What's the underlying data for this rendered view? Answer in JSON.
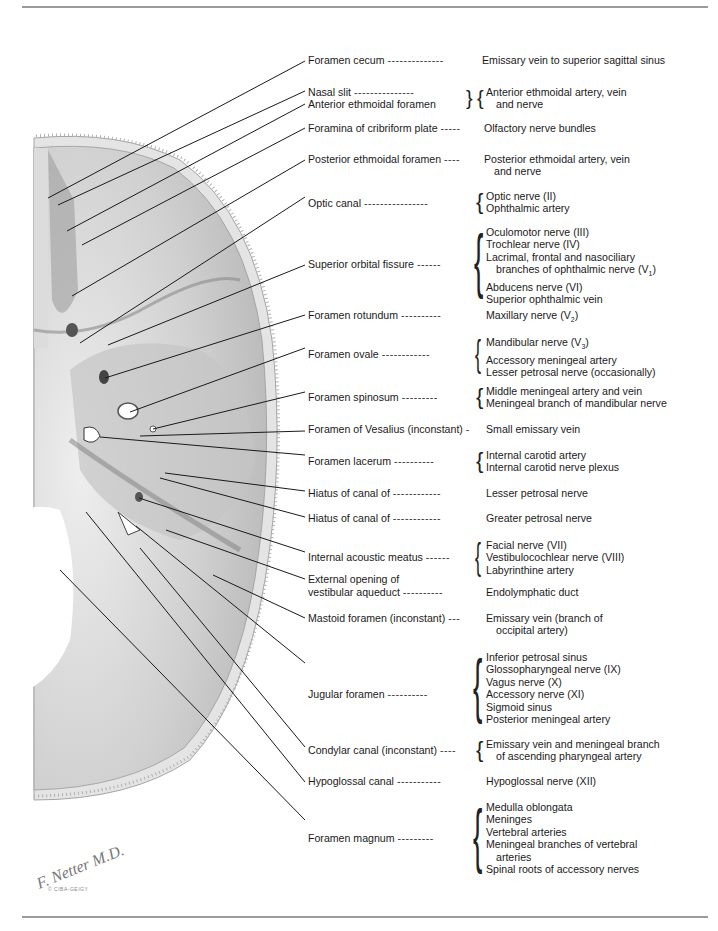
{
  "figure": {
    "rows": [
      {
        "id": "r1",
        "structure": "Foramen cecum",
        "dashes": "--------------",
        "contents": [
          "Emissary vein to superior sagittal sinus"
        ],
        "top": 54
      },
      {
        "id": "r2",
        "structure": "Nasal slit",
        "dashes": "---------------",
        "contents": [
          "Anterior ethmoidal artery, vein",
          "and nerve"
        ],
        "top": 86
      },
      {
        "id": "r2b",
        "structure": "Anterior ethmoidal foramen",
        "dashes": "",
        "contents": [],
        "top": 98
      },
      {
        "id": "r3",
        "structure": "Foramina of cribriform plate",
        "dashes": "-----",
        "contents": [
          "Olfactory nerve bundles"
        ],
        "top": 122
      },
      {
        "id": "r4",
        "structure": "Posterior ethmoidal foramen",
        "dashes": "----",
        "contents": [
          "Posterior ethmoidal artery, vein",
          "and nerve"
        ],
        "top": 153
      },
      {
        "id": "r5",
        "structure": "Optic canal",
        "dashes": "----------------",
        "contents": [
          "Optic nerve (II)",
          "Ophthalmic artery"
        ],
        "top": 190
      },
      {
        "id": "r6",
        "structure": "Superior orbital fissure",
        "dashes": "------",
        "contents": [
          "Oculomotor nerve (III)",
          "Trochlear nerve (IV)",
          "Lacrimal, frontal and nasociliary",
          "branches of ophthalmic nerve (V1)",
          "Abducens nerve (VI)",
          "Superior ophthalmic vein"
        ],
        "top": 226
      },
      {
        "id": "r7",
        "structure": "Foramen rotundum",
        "dashes": "----------",
        "contents": [
          "Maxillary nerve (V2)"
        ],
        "top": 309
      },
      {
        "id": "r8",
        "structure": "Foramen ovale",
        "dashes": "------------",
        "contents": [
          "Mandibular nerve (V3)",
          "Accessory meningeal artery",
          "Lesser petrosal nerve (occasionally)"
        ],
        "top": 336
      },
      {
        "id": "r9",
        "structure": "Foramen spinosum",
        "dashes": "---------",
        "contents": [
          "Middle meningeal artery and vein",
          "Meningeal branch of mandibular nerve"
        ],
        "top": 385
      },
      {
        "id": "r10",
        "structure": "Foramen of Vesalius (inconstant)",
        "dashes": "-",
        "contents": [
          "Small emissary vein"
        ],
        "top": 423
      },
      {
        "id": "r11",
        "structure": "Foramen lacerum",
        "dashes": "----------",
        "contents": [
          "Internal carotid artery",
          "Internal carotid nerve plexus"
        ],
        "top": 449
      },
      {
        "id": "r12",
        "structure": "Hiatus of canal of",
        "dashes": "------------",
        "contents": [
          "Lesser petrosal nerve"
        ],
        "top": 487
      },
      {
        "id": "r13",
        "structure": "Hiatus of canal of",
        "dashes": "------------",
        "contents": [
          "Greater petrosal nerve"
        ],
        "top": 512
      },
      {
        "id": "r14",
        "structure": "Internal acoustic meatus",
        "dashes": "------",
        "contents": [
          "Facial nerve (VII)",
          "Vestibulocochlear nerve (VIII)",
          "Labyrinthine artery"
        ],
        "top": 539
      },
      {
        "id": "r15",
        "structure": "External opening of",
        "dashes": "",
        "contents": [],
        "top": 573
      },
      {
        "id": "r15b",
        "structure": "vestibular aqueduct",
        "dashes": "----------",
        "contents": [
          "Endolymphatic duct"
        ],
        "top": 586
      },
      {
        "id": "r16",
        "structure": "Mastoid foramen (inconstant)",
        "dashes": "---",
        "contents": [
          "Emissary vein (branch of",
          "occipital artery)"
        ],
        "top": 612
      },
      {
        "id": "r17",
        "structure": "Jugular foramen",
        "dashes": "----------",
        "contents": [
          "Inferior petrosal sinus",
          "Glossopharyngeal nerve (IX)",
          "Vagus nerve (X)",
          "Accessory nerve (XI)",
          "Sigmoid sinus",
          "Posterior meningeal artery"
        ],
        "top": 651
      },
      {
        "id": "r18",
        "structure": "Condylar canal (inconstant)",
        "dashes": "----",
        "contents": [
          "Emissary vein and meningeal branch",
          "of ascending pharyngeal artery"
        ],
        "top": 738
      },
      {
        "id": "r19",
        "structure": "Hypoglossal canal",
        "dashes": "-----------",
        "contents": [
          "Hypoglossal nerve (XII)"
        ],
        "top": 775
      },
      {
        "id": "r20",
        "structure": "Foramen magnum",
        "dashes": "---------",
        "contents": [
          "Medulla oblongata",
          "Meninges",
          "Vertebral arteries",
          "Meningeal branches of vertebral",
          "arteries",
          "Spinal roots of accessory nerves"
        ],
        "top": 801
      }
    ],
    "signature": "F. Netter M.D.",
    "copyright": "© CIBA-GEIGY",
    "colors": {
      "rule": "#9a9a9a",
      "leader": "#1a1a1a",
      "bone_light": "#d8d8d8",
      "bone_dark": "#8c8c8c"
    }
  }
}
